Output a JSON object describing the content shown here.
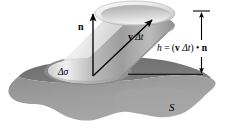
{
  "figure": {
    "labels": {
      "normal_vector": "n",
      "displacement_vector_v": "v",
      "displacement_vector_dt": " Δt",
      "area_element": "Δσ",
      "surface": "S",
      "height_eq_h": "h",
      "height_eq_equals": " = (",
      "height_eq_v": "v",
      "height_eq_dt": " Δt",
      "height_eq_close": ") ",
      "height_eq_dot": "•",
      "height_eq_n": " n",
      "height_equation_plain": "h = (v Δt) • n"
    },
    "colors": {
      "surface_top": "#9a9a9a",
      "surface_rim_dark": "#6f6f6f",
      "surface_shadow": "#8a8a8a",
      "cylinder_light": "#e9e9e9",
      "cylinder_mid": "#b5b5b5",
      "cylinder_dark": "#8e8e8e",
      "top_cap_light": "#f2f2f2",
      "bottom_cap": "#c9c9c9",
      "ink": "#000000",
      "background": "#ffffff"
    }
  }
}
